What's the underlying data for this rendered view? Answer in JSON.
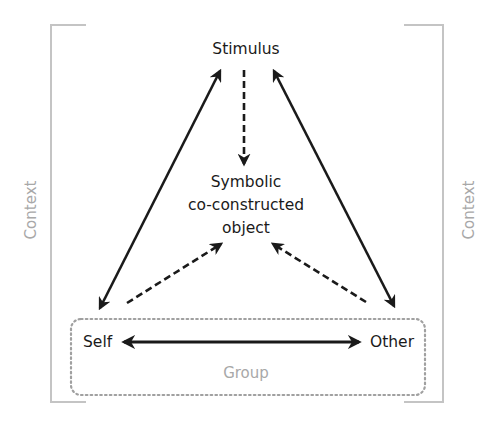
{
  "diagram": {
    "nodes": {
      "stimulus": "Stimulus",
      "object_line1": "Symbolic",
      "object_line2": "co-constructed",
      "object_line3": "object",
      "self": "Self",
      "other": "Other"
    },
    "containers": {
      "group_label": "Group",
      "context_left_label": "Context",
      "context_right_label": "Context"
    },
    "edges": [
      {
        "from": "Self",
        "to": "Stimulus",
        "style": "solid",
        "direction": "both"
      },
      {
        "from": "Other",
        "to": "Stimulus",
        "style": "solid",
        "direction": "both"
      },
      {
        "from": "Stimulus",
        "to": "Symbolic co-constructed object",
        "style": "dashed",
        "direction": "forward"
      },
      {
        "from": "Self",
        "to": "Symbolic co-constructed object",
        "style": "dashed",
        "direction": "forward"
      },
      {
        "from": "Other",
        "to": "Symbolic co-constructed object",
        "style": "dashed",
        "direction": "forward"
      },
      {
        "from": "Self",
        "to": "Other",
        "style": "solid",
        "direction": "both"
      }
    ],
    "colors": {
      "arrow": "#1a1a1a",
      "text": "#1a1a1a",
      "context_bracket": "#bdbdbd",
      "context_text": "#a8a8a8",
      "group_border": "#a0a0a0"
    }
  }
}
